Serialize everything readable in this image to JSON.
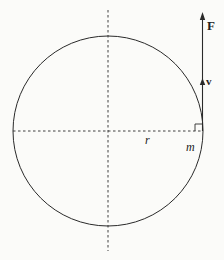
{
  "diagram": {
    "title": "",
    "labels": {
      "force": "F",
      "velocity": "v",
      "radius": "r",
      "mass": "m"
    },
    "colors": {
      "stroke": "#2a2a2a",
      "background": "#fbfbf9"
    },
    "elements": [
      {
        "type": "circle",
        "description": "circular path",
        "center": [
          108,
          131
        ],
        "radius": 95
      },
      {
        "type": "dashed-line",
        "description": "vertical diameter axis"
      },
      {
        "type": "dashed-line",
        "description": "horizontal radius line",
        "label": "r"
      },
      {
        "type": "vector",
        "description": "force vector tangent upward",
        "label": "F"
      },
      {
        "type": "vector",
        "description": "velocity vector tangent upward",
        "label": "v"
      },
      {
        "type": "right-angle-marker",
        "description": "tangent perpendicular to radius"
      },
      {
        "type": "point-mass",
        "label": "m"
      }
    ]
  }
}
